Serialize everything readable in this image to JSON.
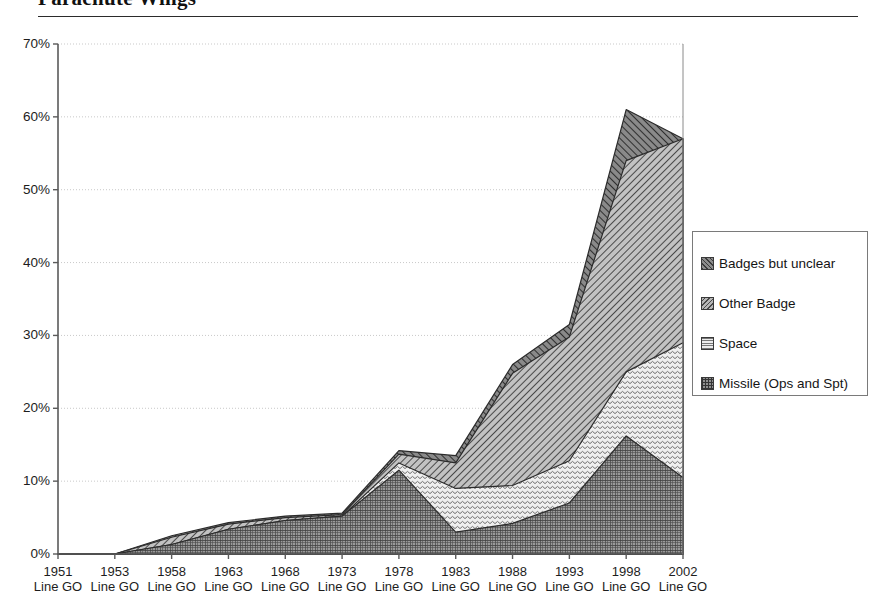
{
  "document": {
    "title": "Parachute Wings"
  },
  "chart_data": {
    "type": "area",
    "stacked": true,
    "title": "Parachute Wings",
    "xlabel": "",
    "ylabel": "",
    "ylim": [
      0,
      70
    ],
    "yticks": [
      0,
      10,
      20,
      30,
      40,
      50,
      60,
      70
    ],
    "ytick_labels": [
      "0%",
      "10%",
      "20%",
      "30%",
      "40%",
      "50%",
      "60%",
      "70%"
    ],
    "grid": true,
    "grid_axis": "y",
    "legend_position": "right",
    "value_unit": "percent",
    "categories": [
      "1951 Line GO",
      "1953 Line GO",
      "1958 Line GO",
      "1963 Line GO",
      "1968 Line GO",
      "1973 Line GO",
      "1978 Line GO",
      "1983 Line GO",
      "1988 Line GO",
      "1993 Line GO",
      "1998 Line GO",
      "2002 Line GO"
    ],
    "category_years": [
      "1951",
      "1953",
      "1958",
      "1963",
      "1968",
      "1973",
      "1978",
      "1983",
      "1988",
      "1993",
      "1998",
      "2002"
    ],
    "category_sublabel": "Line GO",
    "series": [
      {
        "name": "Missile (Ops and Spt)",
        "pattern": "cross-hatch-grid",
        "color": "#909090",
        "values": [
          0.0,
          0.0,
          1.3,
          3.4,
          4.6,
          5.2,
          11.5,
          3.0,
          4.2,
          7.0,
          16.2,
          10.5
        ]
      },
      {
        "name": "Space",
        "pattern": "wavy-light",
        "color": "#ececec",
        "values": [
          0.0,
          0.0,
          0.0,
          0.0,
          0.0,
          0.0,
          1.0,
          6.0,
          5.2,
          5.8,
          8.8,
          18.5
        ]
      },
      {
        "name": "Other Badge",
        "pattern": "diagonal-down",
        "color": "#b7b7b7",
        "values": [
          0.0,
          0.0,
          1.0,
          0.7,
          0.4,
          0.2,
          1.2,
          3.5,
          15.4,
          17.0,
          29.0,
          28.0
        ]
      },
      {
        "name": "Badges but unclear",
        "pattern": "diagonal-up",
        "color": "#8d8d8d",
        "values": [
          0.0,
          0.0,
          0.2,
          0.2,
          0.2,
          0.2,
          0.5,
          1.0,
          1.2,
          1.7,
          7.0,
          0.0
        ]
      }
    ],
    "cumulative_totals": [
      0.0,
      0.0,
      2.5,
      4.3,
      5.2,
      5.6,
      14.2,
      13.5,
      26.0,
      31.5,
      61.0,
      57.0
    ]
  },
  "legend": {
    "items": [
      {
        "label": "Badges but unclear",
        "swatch": "sw-unclear"
      },
      {
        "label": "Other Badge",
        "swatch": "sw-other"
      },
      {
        "label": "Space",
        "swatch": "sw-space"
      },
      {
        "label": "Missile (Ops and Spt)",
        "swatch": "sw-missile"
      }
    ]
  }
}
